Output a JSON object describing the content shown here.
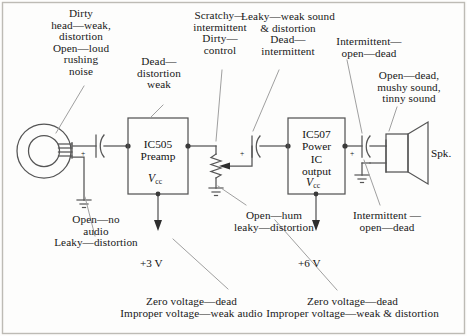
{
  "figure": {
    "border_color": "#b8b6b0",
    "wire_color": "#555555",
    "leader_color": "#8a8a8a",
    "text_color": "#181818"
  },
  "annotations": {
    "head_fault": "Dirty\nhead—weak,\ndistortion\nOpen—loud\nrushing\nnoise",
    "preamp_fault": "Dead—\ndistortion\nweak",
    "control_fault": "Scratchy—\nintermittent\nDirty—\ncontrol",
    "coupling_cap_fault": "Leaky—weak sound\n& distortion\nDead—\nintermittent",
    "output_cap_fault": "Intermittent—\nopen—dead",
    "speaker_fault": "Open—dead,\nmushy sound,\ntinny sound",
    "head_ground_fault": "Open—no\naudio\nLeaky—distortion",
    "bypass_fault": "Open—hum\nleaky—distortion",
    "power_cap_fault": "Intermittent —\nopen—dead",
    "preamp_supply_fault": "Zero voltage—dead\nImproper voltage—weak audio",
    "power_supply_fault": "Zero voltage—dead\nImproper voltage—weak & distortion"
  },
  "components": {
    "preamp": {
      "name": "IC505\nPreamp",
      "vcc_label": "V",
      "vcc_sub": "cc",
      "supply_voltage": "+3 V"
    },
    "power_ic": {
      "name": "IC507\nPower\nIC\noutput",
      "vcc_label": "V",
      "vcc_sub": "cc",
      "supply_voltage": "+6 V"
    },
    "speaker": {
      "label": "Spk."
    },
    "capacitors": {
      "input_polarity": "+",
      "coupling_polarity": "+",
      "output_polarity": "+"
    }
  }
}
